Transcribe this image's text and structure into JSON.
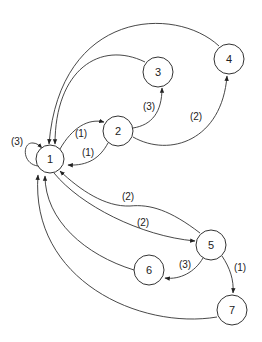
{
  "diagram": {
    "type": "directed-graph",
    "nodes": [
      {
        "id": "1",
        "label": "1",
        "x": 50,
        "y": 159,
        "r": 14
      },
      {
        "id": "2",
        "label": "2",
        "x": 118,
        "y": 131,
        "r": 15
      },
      {
        "id": "3",
        "label": "3",
        "x": 158,
        "y": 72,
        "r": 15
      },
      {
        "id": "4",
        "label": "4",
        "x": 229,
        "y": 59,
        "r": 15
      },
      {
        "id": "5",
        "label": "5",
        "x": 211,
        "y": 245,
        "r": 15
      },
      {
        "id": "6",
        "label": "6",
        "x": 149,
        "y": 270,
        "r": 15
      },
      {
        "id": "7",
        "label": "7",
        "x": 232,
        "y": 310,
        "r": 15
      }
    ],
    "edges": [
      {
        "from": "1",
        "to": "1",
        "label": "(3)"
      },
      {
        "from": "1",
        "to": "2",
        "label": "(1)"
      },
      {
        "from": "2",
        "to": "1",
        "label": "(1)"
      },
      {
        "from": "2",
        "to": "3",
        "label": "(3)"
      },
      {
        "from": "2",
        "to": "4",
        "label": "(2)"
      },
      {
        "from": "3",
        "to": "1",
        "label": ""
      },
      {
        "from": "4",
        "to": "1",
        "label": ""
      },
      {
        "from": "5",
        "to": "1",
        "label": "(2)"
      },
      {
        "from": "1",
        "to": "5",
        "label": "(2)"
      },
      {
        "from": "5",
        "to": "6",
        "label": "(3)"
      },
      {
        "from": "5",
        "to": "7",
        "label": "(1)"
      },
      {
        "from": "6",
        "to": "1",
        "label": ""
      },
      {
        "from": "7",
        "to": "1",
        "label": ""
      }
    ]
  }
}
